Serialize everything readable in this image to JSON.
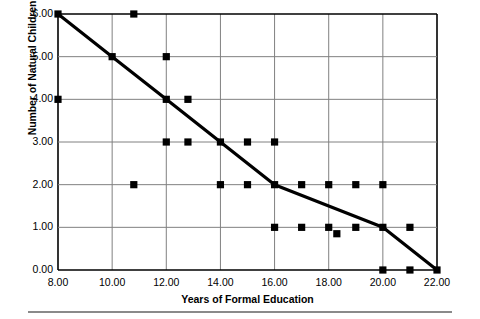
{
  "chart_data": {
    "type": "scatter",
    "title": "",
    "xlabel": "Years of Formal Education",
    "ylabel": "Number of Natural Children",
    "xlim": [
      8,
      22
    ],
    "ylim": [
      0,
      6
    ],
    "xticks": [
      "8.00",
      "10.00",
      "12.00",
      "14.00",
      "16.00",
      "18.00",
      "20.00",
      "22.00"
    ],
    "xtick_values": [
      8,
      10,
      12,
      14,
      16,
      18,
      20,
      22
    ],
    "yticks": [
      "0.00",
      "1.00",
      "2.00",
      "3.00",
      "4.00",
      "5.00",
      "6.00"
    ],
    "ytick_values": [
      0,
      1,
      2,
      3,
      4,
      5,
      6
    ],
    "grid": true,
    "legend": "none",
    "marker_color": "#000000",
    "line_color": "#000000",
    "grid_color": "#808080",
    "axis_color": "#000000",
    "series": [
      {
        "name": "Observations",
        "marker": "square",
        "points": [
          {
            "x": 8,
            "y": 6
          },
          {
            "x": 8,
            "y": 4
          },
          {
            "x": 10,
            "y": 5
          },
          {
            "x": 10.8,
            "y": 6
          },
          {
            "x": 10.8,
            "y": 2
          },
          {
            "x": 12,
            "y": 5
          },
          {
            "x": 12,
            "y": 4
          },
          {
            "x": 12,
            "y": 3
          },
          {
            "x": 12.8,
            "y": 4
          },
          {
            "x": 12.8,
            "y": 3
          },
          {
            "x": 14,
            "y": 3
          },
          {
            "x": 14,
            "y": 2
          },
          {
            "x": 15,
            "y": 3
          },
          {
            "x": 15,
            "y": 2
          },
          {
            "x": 16,
            "y": 3
          },
          {
            "x": 16,
            "y": 2
          },
          {
            "x": 16,
            "y": 1
          },
          {
            "x": 17,
            "y": 2
          },
          {
            "x": 17,
            "y": 1
          },
          {
            "x": 18,
            "y": 2
          },
          {
            "x": 18,
            "y": 1
          },
          {
            "x": 18.3,
            "y": 0.85
          },
          {
            "x": 19,
            "y": 2
          },
          {
            "x": 19,
            "y": 1
          },
          {
            "x": 20,
            "y": 2
          },
          {
            "x": 20,
            "y": 1
          },
          {
            "x": 20,
            "y": 0
          },
          {
            "x": 21,
            "y": 1
          },
          {
            "x": 21,
            "y": 0
          },
          {
            "x": 22,
            "y": 0
          }
        ]
      }
    ],
    "trendline": {
      "name": "Fitted trend",
      "points": [
        {
          "x": 8,
          "y": 6
        },
        {
          "x": 10,
          "y": 5
        },
        {
          "x": 12,
          "y": 4
        },
        {
          "x": 14,
          "y": 3
        },
        {
          "x": 16,
          "y": 2
        },
        {
          "x": 20,
          "y": 1
        },
        {
          "x": 22,
          "y": 0
        }
      ]
    }
  }
}
